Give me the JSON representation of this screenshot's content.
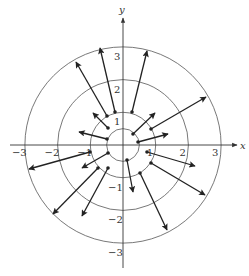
{
  "diagram": {
    "type": "vector_field",
    "axes": {
      "x_label": "x",
      "y_label": "y",
      "x_ticks": [
        {
          "value": -3,
          "label": "−3"
        },
        {
          "value": -2,
          "label": "−2"
        },
        {
          "value": -1,
          "label": "−1"
        },
        {
          "value": 1,
          "label": "1"
        },
        {
          "value": 2,
          "label": "2"
        },
        {
          "value": 3,
          "label": "3"
        }
      ],
      "y_ticks": [
        {
          "value": 3,
          "label": "3"
        },
        {
          "value": 2,
          "label": "2"
        },
        {
          "value": 1,
          "label": "1"
        },
        {
          "value": -1,
          "label": "−1"
        },
        {
          "value": -2,
          "label": "−2"
        },
        {
          "value": -3,
          "label": "−3"
        }
      ]
    },
    "circles_radii": [
      0.5,
      1,
      2,
      3
    ],
    "colors": {
      "axis": "#333333",
      "circle": "#555555",
      "arrow": "#222222"
    },
    "arrows_px": [
      {
        "tail": [
          107,
          116
        ],
        "head": [
          76,
          62
        ]
      },
      {
        "tail": [
          115,
          112
        ],
        "head": [
          100,
          48
        ]
      },
      {
        "tail": [
          132,
          112
        ],
        "head": [
          147,
          51
        ]
      },
      {
        "tail": [
          151,
          129
        ],
        "head": [
          206,
          97
        ]
      },
      {
        "tail": [
          133,
          134
        ],
        "head": [
          155,
          113
        ]
      },
      {
        "tail": [
          138,
          142
        ],
        "head": [
          168,
          134
        ]
      },
      {
        "tail": [
          108,
          128
        ],
        "head": [
          93,
          113
        ]
      },
      {
        "tail": [
          107,
          139
        ],
        "head": [
          79,
          132
        ]
      },
      {
        "tail": [
          90,
          152
        ],
        "head": [
          29,
          169
        ]
      },
      {
        "tail": [
          108,
          153
        ],
        "head": [
          82,
          168
        ]
      },
      {
        "tail": [
          98,
          168
        ],
        "head": [
          53,
          214
        ]
      },
      {
        "tail": [
          108,
          168
        ],
        "head": [
          82,
          216
        ]
      },
      {
        "tail": [
          127,
          160
        ],
        "head": [
          133,
          192
        ]
      },
      {
        "tail": [
          140,
          173
        ],
        "head": [
          167,
          230
        ]
      },
      {
        "tail": [
          147,
          152
        ],
        "head": [
          195,
          166
        ]
      },
      {
        "tail": [
          151,
          163
        ],
        "head": [
          205,
          195
        ]
      }
    ]
  }
}
